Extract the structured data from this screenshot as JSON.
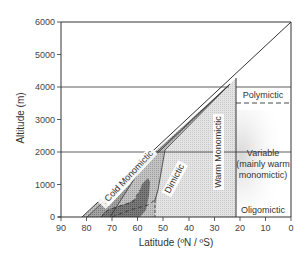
{
  "diagram": {
    "title": "",
    "x_axis": {
      "label": "Latitude (ºN / ºS)",
      "ticks": [
        "90",
        "80",
        "70",
        "60",
        "50",
        "40",
        "30",
        "20",
        "10",
        "0"
      ]
    },
    "y_axis": {
      "label": "Altitude (m)",
      "ticks": [
        "0",
        "1000",
        "2000",
        "3000",
        "4000",
        "5000",
        "6000"
      ]
    },
    "regions": {
      "amictic": "Amictic",
      "cold_monomictic": "Cold Monomictic",
      "dimictic": "Dimictic",
      "warm_monomictic": "Warm Monomictic",
      "polymictic": "Polymictic",
      "variable_line1": "Variable",
      "variable_line2": "(mainly warm",
      "variable_line3": "monomictic)",
      "oligomictic": "Oligomictic"
    },
    "colors": {
      "amictic": "#b8b8b8",
      "cold_monomictic": "#9a9a9a",
      "cold_dark_patch": "#6e6e6e",
      "dimictic": "#c8c8c8",
      "warm_monomictic": "#dedede",
      "variable_stipple": "#e6e6e6",
      "line": "#333333"
    }
  }
}
